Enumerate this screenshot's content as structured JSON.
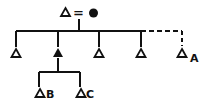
{
  "diagram": {
    "type": "kinship-chart",
    "colors": {
      "ink": "#111111",
      "background": "#ffffff"
    },
    "marriage": {
      "husband": {
        "symbol": "male-open-triangle"
      },
      "connector": "=",
      "wife": {
        "symbol": "female-filled-circle"
      }
    },
    "children": [
      {
        "symbol": "male-open-triangle",
        "label": ""
      },
      {
        "symbol": "male-filled-triangle",
        "label": "",
        "ego": true
      },
      {
        "symbol": "male-open-triangle",
        "label": ""
      },
      {
        "symbol": "male-open-triangle",
        "label": ""
      },
      {
        "symbol": "male-open-triangle",
        "label": "A",
        "link": "dashed"
      }
    ],
    "grandchildren": [
      {
        "symbol": "male-open-triangle",
        "label": "B"
      },
      {
        "symbol": "male-open-triangle",
        "label": "C"
      }
    ]
  }
}
